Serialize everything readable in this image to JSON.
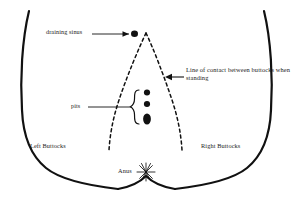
{
  "diagram": {
    "type": "anatomical-line-drawing",
    "background_color": "#ffffff",
    "ink_color": "#111111",
    "text_color": "#1b1b1b",
    "labels": {
      "draining_sinus": "draining sinus",
      "pits": "pits",
      "line_of_contact": "Line of contact between buttocks when standing",
      "left_buttocks": "Left Buttocks",
      "right_buttocks": "Right Buttocks",
      "anus": "Anus"
    },
    "features": {
      "draining_sinus_marker": "filled-dot",
      "pit_markers": "three-filled-ovals",
      "pit_count": 3,
      "anus_marker": "starburst-asterisk",
      "contact_line_style": "dashed",
      "body_outline_style": "solid-thick",
      "brace_orientation": "left-facing-curly-brace"
    }
  }
}
